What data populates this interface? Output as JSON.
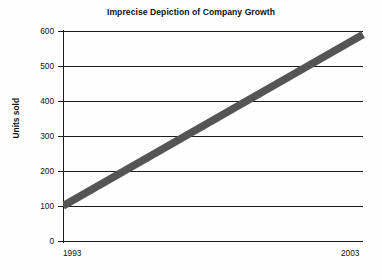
{
  "chart_data": {
    "type": "line",
    "title": "Imprecise Depiction of Company Growth",
    "xlabel": "",
    "ylabel": "Units sold",
    "x": [
      1993,
      2003
    ],
    "series": [
      {
        "name": "Units sold",
        "values": [
          100,
          590
        ],
        "color": "#555555",
        "line_width_units": 22
      }
    ],
    "xlim": [
      1993,
      2003
    ],
    "ylim": [
      0,
      600
    ],
    "xticks": [
      1993,
      2003
    ],
    "xtick_labels": [
      "1993",
      "2003"
    ],
    "yticks": [
      0,
      100,
      200,
      300,
      400,
      500,
      600
    ],
    "ytick_labels": [
      "0",
      "100",
      "200",
      "300",
      "400",
      "500",
      "600"
    ],
    "grid": true,
    "grid_axis": "y",
    "legend": false,
    "legend_position": "none",
    "annotations": []
  },
  "axis": {
    "y_title": "Units sold",
    "tick_labels_y": [
      "600",
      "500",
      "400",
      "300",
      "200",
      "100",
      "0"
    ],
    "tick_label_x_start": "1993",
    "tick_label_x_end": "2003"
  },
  "colors": {
    "background": "#fefefe",
    "axis": "#1b1b1b",
    "grid": "#1b1b1b",
    "series": "#555555",
    "text": "#111111"
  }
}
